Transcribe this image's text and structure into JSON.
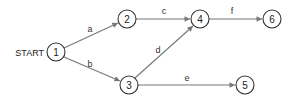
{
  "diagram": {
    "start_label": "START",
    "nodes": [
      {
        "id": "1",
        "label": "1",
        "x": 56,
        "y": 52
      },
      {
        "id": "2",
        "label": "2",
        "x": 127,
        "y": 19
      },
      {
        "id": "3",
        "label": "3",
        "x": 129,
        "y": 85
      },
      {
        "id": "4",
        "label": "4",
        "x": 200,
        "y": 19
      },
      {
        "id": "5",
        "label": "5",
        "x": 245,
        "y": 85
      },
      {
        "id": "6",
        "label": "6",
        "x": 272,
        "y": 19
      }
    ],
    "edges": [
      {
        "from": "1",
        "to": "2",
        "label": "a"
      },
      {
        "from": "1",
        "to": "3",
        "label": "b"
      },
      {
        "from": "2",
        "to": "4",
        "label": "c"
      },
      {
        "from": "3",
        "to": "4",
        "label": "d"
      },
      {
        "from": "3",
        "to": "5",
        "label": "e"
      },
      {
        "from": "4",
        "to": "6",
        "label": "f"
      }
    ],
    "colors": {
      "node_stroke": "#333333",
      "edge_stroke": "#777777",
      "text": "#222222"
    }
  }
}
